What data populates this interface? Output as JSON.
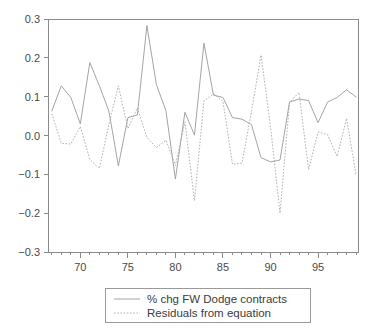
{
  "chart_data": {
    "type": "line",
    "title": "",
    "subtitle": "",
    "xlabel": "",
    "ylabel": "",
    "xlim": [
      1966.6,
      1999.2
    ],
    "ylim": [
      -0.3,
      0.3
    ],
    "grid": false,
    "legend_position": "below-center",
    "y_ticks": [
      "0.3",
      "0.2",
      "0.1",
      "0.0",
      "−0.1",
      "−0.2",
      "−0.3"
    ],
    "y_tick_values": [
      0.3,
      0.2,
      0.1,
      0.0,
      -0.1,
      -0.2,
      -0.3
    ],
    "x_ticks": [
      "70",
      "75",
      "80",
      "85",
      "90",
      "95"
    ],
    "x_tick_values": [
      1970,
      1975,
      1980,
      1985,
      1990,
      1995
    ],
    "x_minor_step": 1,
    "x": [
      1967,
      1968,
      1969,
      1970,
      1971,
      1972,
      1973,
      1974,
      1975,
      1976,
      1977,
      1978,
      1979,
      1980,
      1981,
      1982,
      1983,
      1984,
      1985,
      1986,
      1987,
      1988,
      1989,
      1990,
      1991,
      1992,
      1993,
      1994,
      1995,
      1996,
      1997,
      1998,
      1999
    ],
    "series": [
      {
        "name": "% chg FW Dodge contracts",
        "style": "solid",
        "color": "#9a9a9a",
        "values": [
          0.063,
          0.128,
          0.098,
          0.03,
          0.188,
          0.128,
          0.063,
          -0.078,
          0.046,
          0.053,
          0.283,
          0.131,
          0.064,
          -0.112,
          0.06,
          0.001,
          0.238,
          0.104,
          0.098,
          0.046,
          0.042,
          0.028,
          -0.057,
          -0.068,
          -0.063,
          0.086,
          0.094,
          0.09,
          0.033,
          0.086,
          0.098,
          0.118,
          0.099
        ]
      },
      {
        "name": "Residuals from equation",
        "style": "dotted",
        "color": "#a8a8a8",
        "values": [
          0.056,
          -0.02,
          -0.022,
          0.023,
          -0.062,
          -0.085,
          0.028,
          0.128,
          0.018,
          0.071,
          -0.005,
          -0.031,
          -0.012,
          -0.077,
          0.035,
          -0.168,
          0.089,
          0.107,
          0.088,
          -0.074,
          -0.071,
          0.062,
          0.207,
          0.023,
          -0.2,
          0.085,
          0.111,
          -0.088,
          0.009,
          0.002,
          -0.054,
          0.044,
          -0.102
        ]
      }
    ]
  },
  "legend": {
    "items": [
      {
        "label": "% chg FW Dodge contracts",
        "style": "solid"
      },
      {
        "label": "Residuals from equation",
        "style": "dotted"
      }
    ]
  }
}
